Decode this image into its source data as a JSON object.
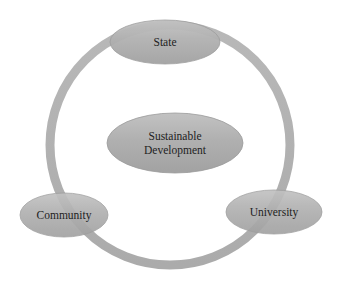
{
  "diagram": {
    "type": "cycle",
    "ring": {
      "cx": 170,
      "cy": 145,
      "r": 120,
      "stroke_width": 9,
      "color": "#b3b3b3"
    },
    "colors": {
      "node_fill": "#a9a9a9",
      "node_highlight": "#c4c4c4",
      "node_stroke": "#9a9a9a",
      "text": "#1e1e1e"
    },
    "center": {
      "label_line1": "Sustainable",
      "label_line2": "Development"
    },
    "nodes": [
      {
        "id": "state",
        "label": "State"
      },
      {
        "id": "community",
        "label": "Community"
      },
      {
        "id": "university",
        "label": "University"
      }
    ]
  }
}
